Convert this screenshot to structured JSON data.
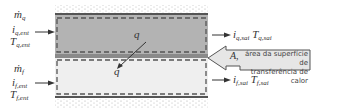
{
  "diagram": {
    "colors": {
      "hot_fluid": "#b3b3b3",
      "cold_fluid": "#efefef",
      "wall": "#666666",
      "dashed_boundary": "#555555",
      "insulation_dots": "#9a9a9a",
      "callout_fill": "#e6e6e6",
      "arrow": "#333333"
    },
    "hot_inlet": {
      "mass_flow": "ṁ",
      "mass_flow_sub": "q",
      "enthalpy": "i",
      "enthalpy_sub": "q,ent",
      "temperature": "T",
      "temperature_sub": "q,ent"
    },
    "cold_inlet": {
      "mass_flow": "ṁ",
      "mass_flow_sub": "f",
      "enthalpy": "i",
      "enthalpy_sub": "f,ent",
      "temperature": "T",
      "temperature_sub": "f,ent"
    },
    "hot_outlet": {
      "enthalpy": "i",
      "enthalpy_sub": "q,sai",
      "temperature": "T",
      "temperature_sub": "q,sai"
    },
    "cold_outlet": {
      "enthalpy": "i",
      "enthalpy_sub": "f,sai",
      "temperature": "T",
      "temperature_sub": "f,sai"
    },
    "heat_flow": {
      "label_top": "q",
      "label_bottom": "q"
    },
    "area_callout": {
      "symbol": "A,",
      "line1": "área da superfície de",
      "line2": "transferência de calor"
    }
  }
}
